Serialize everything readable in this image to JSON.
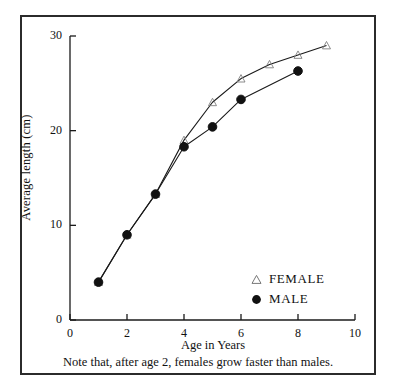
{
  "figure": {
    "caption": "Note that, after age 2, females grow faster than males."
  },
  "axes": {
    "x_title": "Age in Years",
    "y_title": "Average length (cm)",
    "x_ticks": [
      "0",
      "2",
      "4",
      "6",
      "8",
      "10"
    ],
    "y_ticks": [
      "0",
      "10",
      "20",
      "30"
    ]
  },
  "legend": {
    "items": [
      {
        "label": "FEMALE",
        "marker": "open-triangle-marker",
        "color": "#555555"
      },
      {
        "label": "MALE",
        "marker": "filled-circle-marker",
        "color": "#111111"
      }
    ]
  },
  "chart_data": {
    "type": "line",
    "title": "",
    "xlabel": "Age in Years",
    "ylabel": "Average length (cm)",
    "xlim": [
      0,
      10
    ],
    "ylim": [
      0,
      30
    ],
    "xticks": [
      0,
      2,
      4,
      6,
      8,
      10
    ],
    "yticks": [
      0,
      10,
      20,
      30
    ],
    "grid": false,
    "legend_position": "bottom-right",
    "annotation": "Note that, after age 2, females grow faster than males.",
    "series": [
      {
        "name": "FEMALE",
        "marker": "open-triangle",
        "color": "#555555",
        "x": [
          1,
          2,
          3,
          4,
          5,
          6,
          7,
          8,
          9
        ],
        "values": [
          4,
          9,
          13.3,
          19,
          23,
          25.5,
          27,
          28,
          29
        ]
      },
      {
        "name": "MALE",
        "marker": "filled-circle",
        "color": "#111111",
        "x": [
          1,
          2,
          3,
          4,
          5,
          6,
          8
        ],
        "values": [
          4,
          9,
          13.3,
          18.3,
          20.4,
          23.3,
          26.3
        ]
      }
    ]
  }
}
